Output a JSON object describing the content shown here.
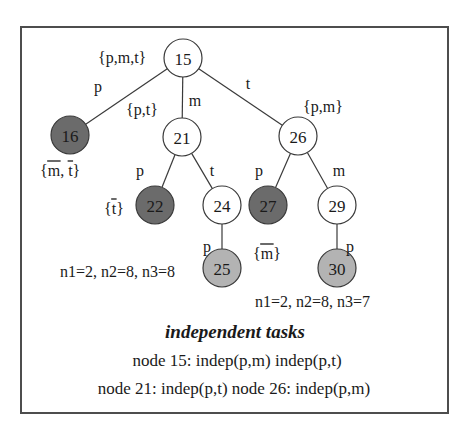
{
  "figure": {
    "colors": {
      "frame_border": "#4d4d4d",
      "background": "#ffffff",
      "node_stroke": "#3a3a3a",
      "node_fill_white": "#ffffff",
      "node_fill_dark": "#6b6b6b",
      "node_fill_light": "#b3b3b3",
      "text": "#1a1a1a"
    },
    "tree": {
      "nodes": [
        {
          "id": "n15",
          "label": "15",
          "x": 183,
          "y": 58,
          "r": 19,
          "shade": "white"
        },
        {
          "id": "n16",
          "label": "16",
          "x": 70,
          "y": 135,
          "r": 19,
          "shade": "dark"
        },
        {
          "id": "n21",
          "label": "21",
          "x": 182,
          "y": 137,
          "r": 19,
          "shade": "white"
        },
        {
          "id": "n26",
          "label": "26",
          "x": 298,
          "y": 136,
          "r": 19,
          "shade": "white"
        },
        {
          "id": "n22",
          "label": "22",
          "x": 155,
          "y": 205,
          "r": 19,
          "shade": "dark"
        },
        {
          "id": "n24",
          "label": "24",
          "x": 222,
          "y": 205,
          "r": 19,
          "shade": "white"
        },
        {
          "id": "n27",
          "label": "27",
          "x": 268,
          "y": 205,
          "r": 19,
          "shade": "dark"
        },
        {
          "id": "n29",
          "label": "29",
          "x": 337,
          "y": 205,
          "r": 19,
          "shade": "white"
        },
        {
          "id": "n25",
          "label": "25",
          "x": 222,
          "y": 268,
          "r": 19,
          "shade": "light"
        },
        {
          "id": "n30",
          "label": "30",
          "x": 337,
          "y": 268,
          "r": 19,
          "shade": "light"
        }
      ],
      "edges": [
        {
          "id": "e15-16",
          "from": "n15",
          "to": "n16",
          "label": "p",
          "lx": 98,
          "ly": 86
        },
        {
          "id": "e15-21",
          "from": "n15",
          "to": "n21",
          "label": "m",
          "lx": 195,
          "ly": 100
        },
        {
          "id": "e15-26",
          "from": "n15",
          "to": "n26",
          "label": "t",
          "lx": 248,
          "ly": 83
        },
        {
          "id": "e21-22",
          "from": "n21",
          "to": "n22",
          "label": "p",
          "lx": 140,
          "ly": 170
        },
        {
          "id": "e21-24",
          "from": "n21",
          "to": "n24",
          "label": "t",
          "lx": 212,
          "ly": 170
        },
        {
          "id": "e26-27",
          "from": "n26",
          "to": "n27",
          "label": "p",
          "lx": 259,
          "ly": 170
        },
        {
          "id": "e26-29",
          "from": "n26",
          "to": "n29",
          "label": "m",
          "lx": 339,
          "ly": 170
        },
        {
          "id": "e24-25",
          "from": "n24",
          "to": "n25",
          "label": "p",
          "lx": 207,
          "ly": 246
        },
        {
          "id": "e29-30",
          "from": "n29",
          "to": "n30",
          "label": "p",
          "lx": 350,
          "ly": 246
        }
      ]
    },
    "set_labels": [
      {
        "id": "s15",
        "text": "{p,m,t}",
        "x": 98,
        "y": 57,
        "anchor": "start",
        "overbars": []
      },
      {
        "id": "s21",
        "text": "{p,t}",
        "x": 126,
        "y": 109,
        "anchor": "start",
        "overbars": []
      },
      {
        "id": "s26",
        "text": "{p,m}",
        "x": 303,
        "y": 106,
        "anchor": "start",
        "overbars": []
      },
      {
        "id": "s16",
        "text": "{m, t}",
        "x": 40,
        "y": 170,
        "anchor": "start",
        "overbars": [
          "m",
          "t"
        ]
      },
      {
        "id": "s22",
        "text": "{t}",
        "x": 104,
        "y": 208,
        "anchor": "start",
        "overbars": [
          "t"
        ]
      },
      {
        "id": "s27",
        "text": "{m}",
        "x": 253,
        "y": 253,
        "anchor": "start",
        "overbars": [
          "m"
        ]
      }
    ],
    "stats": [
      {
        "id": "stat-left",
        "text": "n1=2, n2=8, n3=8",
        "x": 60,
        "y": 271,
        "anchor": "start"
      },
      {
        "id": "stat-right",
        "text": "n1=2, n2=8, n3=7",
        "x": 255,
        "y": 301,
        "anchor": "start"
      }
    ],
    "caption": {
      "heading": "independent tasks",
      "heading_x": 235,
      "heading_y": 331,
      "lines": [
        {
          "id": "cap1",
          "text": "node 15: indep(p,m) indep(p,t)",
          "x": 237,
          "y": 360
        },
        {
          "id": "cap2",
          "text": "node 21: indep(p,t)   node 26: indep(p,m)",
          "x": 234,
          "y": 388
        }
      ]
    }
  }
}
